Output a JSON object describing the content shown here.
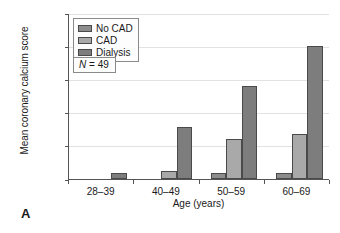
{
  "panel": {
    "letter": "A"
  },
  "chart_data": {
    "type": "bar",
    "title": "",
    "xlabel": "Age (years)",
    "ylabel": "Mean coronary calcium score",
    "categories": [
      "28–39",
      "40–49",
      "50–59",
      "60–69"
    ],
    "series": [
      {
        "name": "No CAD",
        "color": "#8c8c8c",
        "values": [
          0,
          0,
          85,
          85
        ]
      },
      {
        "name": "CAD",
        "color": "#a9a9a9",
        "values": [
          0,
          125,
          600,
          675
        ]
      },
      {
        "name": "Dialysis",
        "color": "#7d7d7d",
        "values": [
          90,
          780,
          1400,
          2010
        ]
      }
    ],
    "ylim": [
      0,
      2500
    ],
    "yticks": [
      0,
      500,
      1000,
      1500,
      2000,
      2500
    ],
    "ytick_labels": [
      "0",
      "500",
      "1,000",
      "1,500",
      "2,000",
      "2,500"
    ],
    "grid": true,
    "legend_position": "top-left",
    "annotations": [
      {
        "name": "sample-size",
        "prefix": "N",
        "text": " = 49"
      }
    ]
  }
}
